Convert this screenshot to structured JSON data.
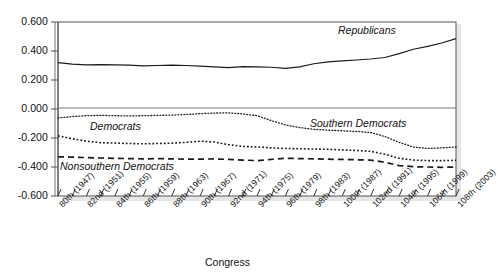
{
  "chart_data": {
    "type": "line",
    "title": "",
    "xlabel": "Congress",
    "ylabel": "",
    "ylim": [
      -0.6,
      0.6
    ],
    "grid": false,
    "legend_position": "inline-annotations",
    "ytick_labels": [
      "0.600",
      "0.400",
      "0.200",
      "0.000",
      "-0.200",
      "-0.400",
      "-0.600"
    ],
    "ytick_values": [
      0.6,
      0.4,
      0.2,
      0.0,
      -0.2,
      -0.4,
      -0.6
    ],
    "xtick_labels": [
      "80th (1947)",
      "82nd (1951)",
      "84th (1955)",
      "86th (1959)",
      "88th (1963)",
      "90th (1967)",
      "92nd (1971)",
      "94th (1975)",
      "96th (1979)",
      "98th (1983)",
      "100th (1987)",
      "102nd (1991)",
      "104th (1995)",
      "106th (1999)",
      "108th (2003)"
    ],
    "x": [
      80,
      81,
      82,
      83,
      84,
      85,
      86,
      87,
      88,
      89,
      90,
      91,
      92,
      93,
      94,
      95,
      96,
      97,
      98,
      99,
      100,
      101,
      102,
      103,
      104,
      105,
      106,
      107,
      108
    ],
    "series": [
      {
        "name": "Republicans",
        "style": "solid",
        "values": [
          0.32,
          0.31,
          0.305,
          0.306,
          0.304,
          0.302,
          0.297,
          0.3,
          0.302,
          0.3,
          0.296,
          0.29,
          0.286,
          0.292,
          0.29,
          0.288,
          0.28,
          0.29,
          0.312,
          0.325,
          0.332,
          0.338,
          0.345,
          0.355,
          0.382,
          0.412,
          0.432,
          0.455,
          0.485
        ]
      },
      {
        "name": "Southern Democrats",
        "style": "dotted-fine",
        "values": [
          -0.062,
          -0.052,
          -0.046,
          -0.044,
          -0.046,
          -0.048,
          -0.046,
          -0.044,
          -0.042,
          -0.038,
          -0.032,
          -0.028,
          -0.026,
          -0.034,
          -0.046,
          -0.08,
          -0.11,
          -0.128,
          -0.14,
          -0.146,
          -0.15,
          -0.155,
          -0.162,
          -0.19,
          -0.23,
          -0.262,
          -0.272,
          -0.268,
          -0.262
        ]
      },
      {
        "name": "Democrats",
        "style": "dotted-medium",
        "values": [
          -0.185,
          -0.205,
          -0.222,
          -0.232,
          -0.235,
          -0.238,
          -0.24,
          -0.238,
          -0.236,
          -0.23,
          -0.222,
          -0.228,
          -0.246,
          -0.258,
          -0.262,
          -0.268,
          -0.272,
          -0.274,
          -0.276,
          -0.278,
          -0.282,
          -0.286,
          -0.292,
          -0.312,
          -0.34,
          -0.352,
          -0.356,
          -0.356,
          -0.354
        ]
      },
      {
        "name": "Nonsouthern Democrats",
        "style": "dashed",
        "values": [
          -0.33,
          -0.332,
          -0.335,
          -0.338,
          -0.34,
          -0.342,
          -0.344,
          -0.342,
          -0.344,
          -0.346,
          -0.346,
          -0.344,
          -0.348,
          -0.352,
          -0.356,
          -0.348,
          -0.34,
          -0.342,
          -0.344,
          -0.346,
          -0.348,
          -0.35,
          -0.352,
          -0.368,
          -0.39,
          -0.398,
          -0.4,
          -0.402,
          -0.4
        ]
      }
    ],
    "annotations": [
      {
        "text": "Republicans",
        "series": "Republicans"
      },
      {
        "text": "Southern Democrats",
        "series": "Southern Democrats"
      },
      {
        "text": "Democrats",
        "series": "Democrats"
      },
      {
        "text": "Nonsouthern Democrats",
        "series": "Nonsouthern Democrats"
      }
    ],
    "colors": {
      "line": "#1a1a1a",
      "axis": "#5a5a5a",
      "background": "#ffffff",
      "shadow": "#bdbdbd"
    }
  }
}
